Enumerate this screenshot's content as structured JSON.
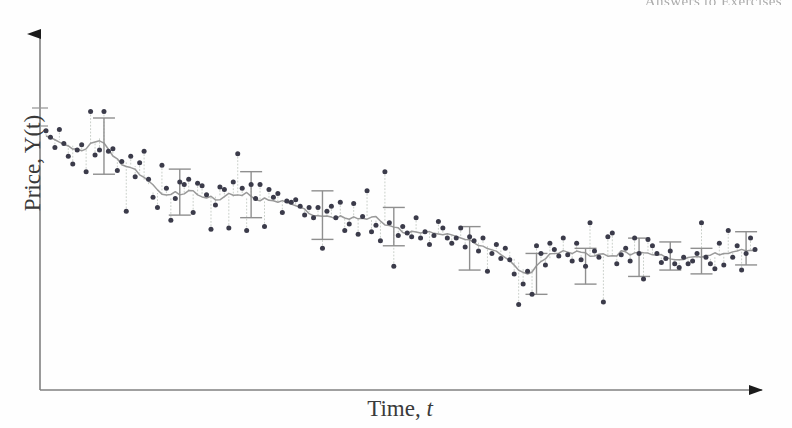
{
  "page": {
    "running_head": "Answers to Exercises",
    "background_color": "#fefefe"
  },
  "figure": {
    "y_axis_title": "Price, Y(t)",
    "x_axis_title_main": "Time, ",
    "x_axis_title_italic": "t",
    "axis_color": "#808080",
    "marker_color": "#3b3b4a",
    "dotted_color": "#c9cfc9",
    "trend_color": "#9a9a9a",
    "errorbar_color": "#8f8f8f"
  },
  "chart_data": {
    "type": "scatter",
    "title": "",
    "xlabel": "Time, t",
    "ylabel": "Price, Y(t)",
    "grid": false,
    "legend": null,
    "axes": {
      "x_ticks": [],
      "y_ticks": [
        "tick-1",
        "tick-2"
      ],
      "x_tick_labels": [],
      "y_tick_labels": [],
      "x_arrow": true,
      "y_arrow": true,
      "x_range_note": "unlabelled time index, 0 to 160",
      "y_range_note": "unlabelled price level, arbitrary units"
    },
    "series": [
      {
        "name": "Observed price",
        "marker": "filled-circle",
        "x": [
          0,
          1,
          2,
          3,
          4,
          5,
          6,
          7,
          8,
          9,
          10,
          11,
          12,
          13,
          14,
          15,
          16,
          17,
          18,
          19,
          20,
          21,
          22,
          23,
          24,
          25,
          26,
          27,
          28,
          29,
          30,
          31,
          32,
          33,
          34,
          35,
          36,
          37,
          38,
          39,
          40,
          41,
          42,
          43,
          44,
          45,
          46,
          47,
          48,
          49,
          50,
          51,
          52,
          53,
          54,
          55,
          56,
          57,
          58,
          59,
          60,
          61,
          62,
          63,
          64,
          65,
          66,
          67,
          68,
          69,
          70,
          71,
          72,
          73,
          74,
          75,
          76,
          77,
          78,
          79,
          80,
          81,
          82,
          83,
          84,
          85,
          86,
          87,
          88,
          89,
          90,
          91,
          92,
          93,
          94,
          95,
          96,
          97,
          98,
          99,
          100,
          101,
          102,
          103,
          104,
          105,
          106,
          107,
          108,
          109,
          110,
          111,
          112,
          113,
          114,
          115,
          116,
          117,
          118,
          119,
          120,
          121,
          122,
          123,
          124,
          125,
          126,
          127,
          128,
          129,
          130,
          131,
          132,
          133,
          134,
          135,
          136,
          137,
          138,
          139,
          140,
          141,
          142,
          143,
          144,
          145,
          146,
          147,
          148,
          149,
          150,
          151,
          152,
          153,
          154,
          155,
          156,
          157,
          158,
          159
        ],
        "y": [
          86.0,
          83.5,
          79.5,
          86.5,
          81.0,
          76.0,
          73.0,
          78.5,
          80.5,
          70.0,
          93.5,
          76.5,
          78.5,
          93.5,
          78.0,
          79.0,
          70.5,
          74.0,
          54.5,
          76.0,
          68.0,
          73.5,
          78.0,
          67.0,
          60.0,
          56.0,
          72.5,
          63.5,
          51.0,
          59.5,
          66.0,
          65.0,
          67.0,
          54.0,
          65.5,
          64.5,
          61.0,
          47.5,
          57.0,
          64.0,
          63.0,
          48.0,
          66.0,
          77.0,
          63.5,
          47.0,
          65.0,
          59.5,
          65.0,
          48.5,
          63.0,
          60.0,
          61.5,
          54.0,
          58.5,
          58.0,
          59.0,
          56.5,
          53.0,
          56.0,
          52.0,
          56.0,
          40.0,
          54.5,
          56.5,
          52.0,
          58.0,
          47.0,
          49.5,
          57.5,
          45.5,
          52.5,
          62.5,
          46.5,
          49.0,
          43.0,
          70.0,
          50.0,
          33.0,
          45.0,
          48.5,
          46.0,
          44.5,
          52.0,
          44.0,
          46.5,
          41.5,
          45.0,
          50.5,
          48.0,
          44.0,
          42.0,
          44.0,
          48.0,
          40.5,
          44.5,
          43.0,
          39.0,
          44.0,
          31.0,
          38.0,
          41.5,
          36.0,
          40.0,
          35.5,
          30.0,
          18.0,
          26.0,
          31.0,
          22.0,
          41.0,
          38.0,
          33.5,
          42.0,
          39.5,
          37.0,
          44.0,
          37.5,
          35.0,
          42.0,
          35.5,
          33.0,
          50.0,
          39.0,
          36.5,
          19.0,
          44.5,
          46.0,
          34.0,
          37.5,
          40.0,
          35.0,
          44.0,
          38.0,
          28.0,
          43.5,
          41.0,
          38.0,
          34.5,
          36.0,
          39.0,
          34.0,
          32.5,
          36.5,
          34.0,
          35.0,
          38.0,
          50.0,
          36.5,
          34.0,
          32.0,
          42.0,
          33.5,
          47.0,
          36.5,
          41.0,
          31.5,
          38.0,
          44.0,
          39.5
        ]
      },
      {
        "name": "Trend (moving average)",
        "marker": "none",
        "line": "solid",
        "x": [
          0,
          4,
          8,
          12,
          16,
          20,
          24,
          28,
          32,
          36,
          40,
          44,
          48,
          52,
          56,
          60,
          64,
          68,
          72,
          76,
          80,
          84,
          88,
          92,
          96,
          100,
          104,
          108,
          112,
          116,
          120,
          124,
          128,
          132,
          136,
          140,
          144,
          148,
          152,
          156,
          159
        ],
        "y": [
          84.0,
          82.0,
          78.0,
          83.0,
          75.0,
          72.0,
          62.0,
          60.0,
          62.0,
          60.5,
          60.0,
          60.5,
          59.0,
          58.5,
          57.0,
          53.0,
          52.5,
          51.0,
          52.0,
          50.5,
          47.0,
          46.5,
          46.0,
          45.0,
          43.0,
          40.5,
          38.5,
          30.5,
          35.5,
          38.5,
          38.0,
          37.0,
          37.5,
          38.5,
          38.0,
          36.0,
          35.5,
          36.0,
          38.0,
          39.5,
          40.0
        ]
      }
    ],
    "error_bars": [
      {
        "x": 13,
        "y": 80.0,
        "err": 11.0
      },
      {
        "x": 30,
        "y": 62.0,
        "err": 9.0
      },
      {
        "x": 46,
        "y": 61.0,
        "err": 9.0
      },
      {
        "x": 62,
        "y": 53.0,
        "err": 9.5
      },
      {
        "x": 78,
        "y": 48.5,
        "err": 7.5
      },
      {
        "x": 95,
        "y": 40.0,
        "err": 8.5
      },
      {
        "x": 110,
        "y": 30.0,
        "err": 8.0
      },
      {
        "x": 121,
        "y": 33.0,
        "err": 7.0
      },
      {
        "x": 133,
        "y": 36.5,
        "err": 7.5
      },
      {
        "x": 140,
        "y": 37.0,
        "err": 5.5
      },
      {
        "x": 147,
        "y": 35.0,
        "err": 5.0
      },
      {
        "x": 157,
        "y": 40.0,
        "err": 6.5
      }
    ]
  }
}
